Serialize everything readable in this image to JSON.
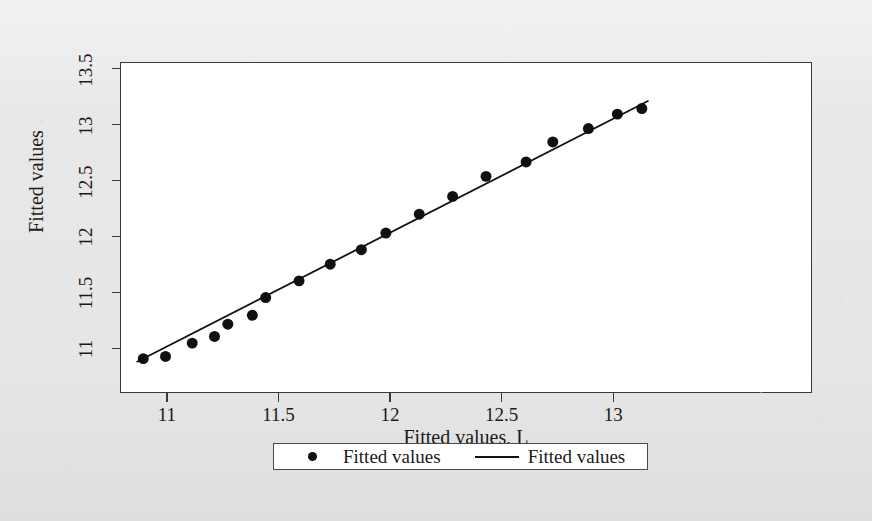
{
  "figure": {
    "background_color": "#ebebeb",
    "plot_background_color": "#ffffff",
    "frame_color": "#3a3a3a",
    "ink_color": "#101010"
  },
  "axes": {
    "x": {
      "title": "Fitted values, L",
      "ticks": [
        "11",
        "11.5",
        "12",
        "12.5",
        "13"
      ],
      "tick_values": [
        11,
        11.5,
        12,
        12.5,
        13
      ],
      "min": 10.79,
      "max": 13.89
    },
    "y": {
      "title": "Fitted values",
      "ticks": [
        "11",
        "11.5",
        "12",
        "12.5",
        "13",
        "13.5"
      ],
      "tick_values": [
        11,
        11.5,
        12,
        12.5,
        13,
        13.5
      ],
      "min": 10.6,
      "max": 13.56
    }
  },
  "legend": {
    "entries": [
      {
        "key": "marker",
        "label": "Fitted values"
      },
      {
        "key": "line",
        "label": "Fitted values"
      }
    ]
  },
  "chart_data": {
    "type": "scatter",
    "title": "",
    "xlabel": "Fitted values, L",
    "ylabel": "Fitted values",
    "xlim": [
      10.79,
      13.89
    ],
    "ylim": [
      10.6,
      13.56
    ],
    "grid": false,
    "legend_position": "bottom",
    "series": [
      {
        "name": "Fitted values",
        "type": "scatter",
        "marker": "filled-circle",
        "marker_size": 11,
        "color": "#101010",
        "points": [
          {
            "x": 10.89,
            "y": 10.9
          },
          {
            "x": 10.99,
            "y": 10.92
          },
          {
            "x": 11.11,
            "y": 11.04
          },
          {
            "x": 11.21,
            "y": 11.1
          },
          {
            "x": 11.27,
            "y": 11.21
          },
          {
            "x": 11.38,
            "y": 11.29
          },
          {
            "x": 11.44,
            "y": 11.45
          },
          {
            "x": 11.59,
            "y": 11.6
          },
          {
            "x": 11.73,
            "y": 11.75
          },
          {
            "x": 11.87,
            "y": 11.88
          },
          {
            "x": 11.98,
            "y": 12.03
          },
          {
            "x": 12.13,
            "y": 12.2
          },
          {
            "x": 12.28,
            "y": 12.36
          },
          {
            "x": 12.43,
            "y": 12.54
          },
          {
            "x": 12.61,
            "y": 12.67
          },
          {
            "x": 12.73,
            "y": 12.85
          },
          {
            "x": 12.89,
            "y": 12.97
          },
          {
            "x": 13.02,
            "y": 13.1
          },
          {
            "x": 13.13,
            "y": 13.15
          }
        ]
      },
      {
        "name": "Fitted values",
        "type": "line",
        "color": "#101010",
        "width": 1.8,
        "points": [
          {
            "x": 10.86,
            "y": 10.87
          },
          {
            "x": 13.16,
            "y": 13.22
          }
        ]
      }
    ]
  }
}
